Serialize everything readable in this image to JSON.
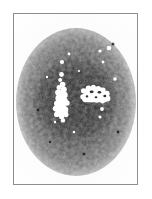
{
  "figure": {
    "kind": "micrograph-plate",
    "caption": "",
    "frame": {
      "border_color": "#8d8d8d",
      "background_color": "#fdfdfd",
      "x": 13,
      "y": 13,
      "width": 125,
      "height": 172
    }
  },
  "chart_data": {
    "type": "heatmap",
    "title": "",
    "subtitle": "",
    "xlabel": "",
    "ylabel": "",
    "legend_position": "none",
    "grid": false,
    "colors": {
      "background": "#ffffff",
      "plate_background": "#fcfcfc",
      "grain_dark": "#1d1d1d",
      "grain_mid": "#6b6b6b",
      "grain_light": "#c2c2c2",
      "core_dark": "#141414",
      "highlight_white": "#ffffff",
      "frame_line": "#8d8d8d"
    },
    "field": {
      "center_x": 62,
      "center_y": 88,
      "halo_radius_x": 60,
      "halo_radius_y": 74,
      "core_radius_x": 40,
      "core_radius_y": 40
    },
    "clusters": [
      {
        "name": "left-vertical-chain",
        "orientation": "vertical",
        "center_x": 47,
        "center_y": 88,
        "blob_count": 19,
        "intensity": 255
      },
      {
        "name": "right-horizontal-cluster",
        "orientation": "horizontal",
        "center_x": 83,
        "center_y": 84,
        "blob_count": 16,
        "intensity": 255
      }
    ],
    "satellite_specks": [
      {
        "x": 48,
        "y": 58,
        "r": 2.1
      },
      {
        "x": 55,
        "y": 49,
        "r": 1.5
      },
      {
        "x": 86,
        "y": 47,
        "r": 1.6
      },
      {
        "x": 95,
        "y": 44,
        "r": 2.3
      },
      {
        "x": 89,
        "y": 58,
        "r": 1.4
      },
      {
        "x": 88,
        "y": 105,
        "r": 1.9
      },
      {
        "x": 86,
        "y": 113,
        "r": 1.5
      },
      {
        "x": 60,
        "y": 128,
        "r": 1.3
      },
      {
        "x": 41,
        "y": 118,
        "r": 1.2
      },
      {
        "x": 101,
        "y": 75,
        "r": 1.8
      }
    ],
    "values": [
      255,
      200,
      150,
      100,
      60,
      30,
      20
    ],
    "categories": [
      "white",
      "light",
      "mid-light",
      "mid",
      "mid-dark",
      "dark",
      "core"
    ]
  }
}
